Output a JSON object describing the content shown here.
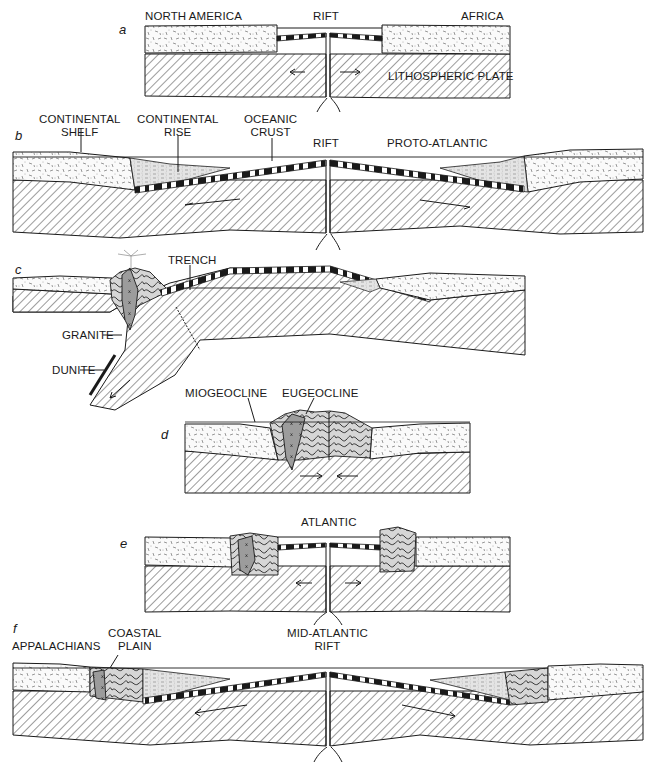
{
  "figure": {
    "panels": [
      {
        "letter": "a",
        "labels": {
          "north_america": "NORTH AMERICA",
          "rift": "RIFT",
          "africa": "AFRICA",
          "lithospheric_plate": "LITHOSPHERIC PLATE"
        }
      },
      {
        "letter": "b",
        "labels": {
          "continental_shelf_1": "CONTINENTAL",
          "continental_shelf_2": "SHELF",
          "continental_rise_1": "CONTINENTAL",
          "continental_rise_2": "RISE",
          "oceanic_crust_1": "OCEANIC",
          "oceanic_crust_2": "CRUST",
          "rift": "RIFT",
          "proto_atlantic": "PROTO-ATLANTIC"
        }
      },
      {
        "letter": "c",
        "labels": {
          "trench": "TRENCH",
          "granite": "GRANITE",
          "dunite": "DUNITE"
        }
      },
      {
        "letter": "d",
        "labels": {
          "miogeocline": "MIOGEOCLINE",
          "eugeocline": "EUGEOCLINE"
        }
      },
      {
        "letter": "e",
        "labels": {
          "atlantic": "ATLANTIC"
        }
      },
      {
        "letter": "f",
        "labels": {
          "appalachians": "APPALACHIANS",
          "coastal_plain_1": "COASTAL",
          "coastal_plain_2": "PLAIN",
          "mid_atlantic_rift_1": "MID-ATLANTIC",
          "mid_atlantic_rift_2": "RIFT"
        }
      }
    ],
    "colors": {
      "ink": "#1a1a1a",
      "background": "#ffffff",
      "granite_fill": "#9a9a9a",
      "fold_fill": "#d4d4d4",
      "sediment_fill": "#e6e6e6"
    }
  }
}
